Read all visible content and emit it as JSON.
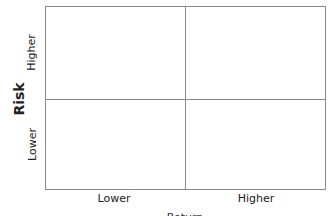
{
  "diagram": {
    "type": "2x2 matrix",
    "y_axis": {
      "title": "Risk",
      "labels": [
        "Higher",
        "Lower"
      ]
    },
    "x_axis": {
      "title": "Return",
      "labels": [
        "Lower",
        "Higher"
      ]
    },
    "line_color": "#8a8a8a"
  }
}
